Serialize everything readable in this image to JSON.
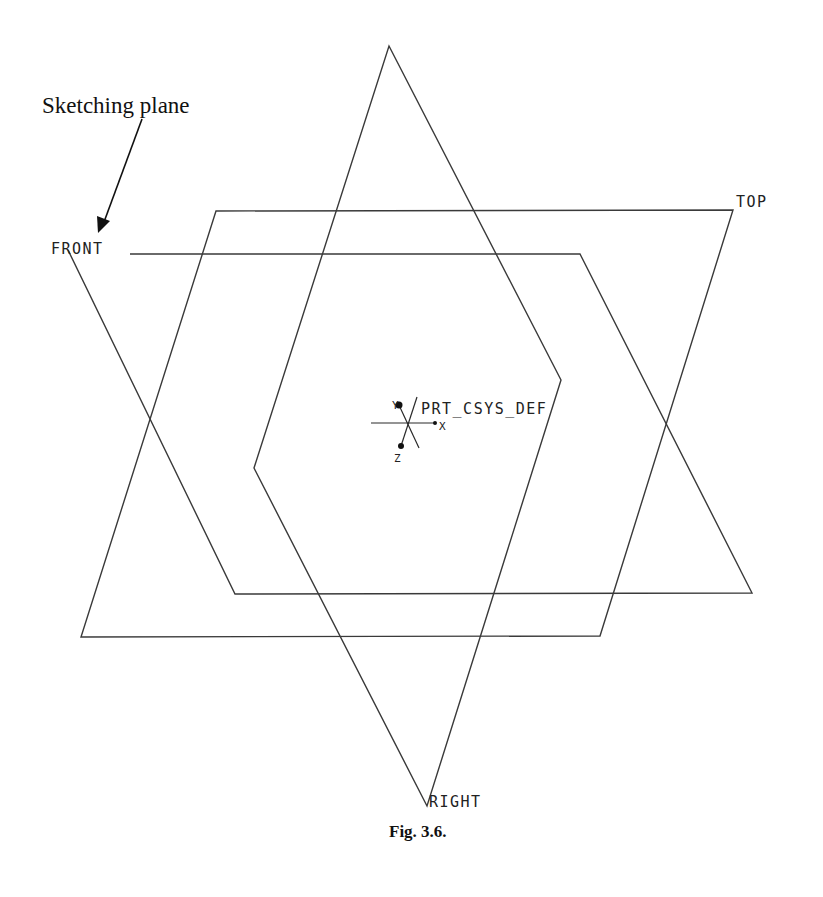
{
  "annotation": {
    "text": "Sketching plane",
    "arrow_target": "FRONT"
  },
  "planes": [
    {
      "name": "FRONT",
      "label": "FRONT",
      "points": [
        [
          68,
          248
        ],
        [
          130,
          254
        ],
        [
          580,
          254
        ],
        [
          752,
          593
        ],
        [
          235,
          594
        ]
      ]
    },
    {
      "name": "TOP",
      "label": "TOP",
      "points": [
        [
          216,
          211
        ],
        [
          733,
          210
        ],
        [
          600,
          636
        ],
        [
          81,
          637
        ]
      ]
    },
    {
      "name": "RIGHT",
      "label": "RIGHT",
      "points": [
        [
          389,
          46
        ],
        [
          561,
          380
        ],
        [
          427,
          806
        ],
        [
          254,
          468
        ]
      ]
    }
  ],
  "csys": {
    "label": "PRT_CSYS_DEF",
    "axes": {
      "x": "X",
      "y": "Y",
      "z": "Z"
    }
  },
  "caption": {
    "text": "Fig. 3.6."
  },
  "colors": {
    "line": "#3a3a3a",
    "text": "#222222",
    "background": "#ffffff"
  }
}
